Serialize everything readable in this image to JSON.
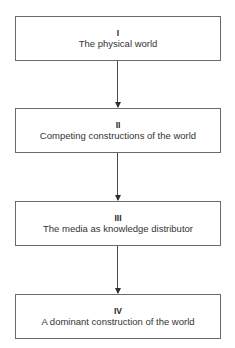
{
  "diagram": {
    "type": "vertical-flowchart",
    "boxes": [
      {
        "numeral": "I",
        "label": "The physical world"
      },
      {
        "numeral": "II",
        "label": "Competing constructions of the world"
      },
      {
        "numeral": "III",
        "label": "The media as knowledge distributor"
      },
      {
        "numeral": "IV",
        "label": "A dominant construction of the world"
      }
    ],
    "connections": [
      {
        "from": "I",
        "to": "II",
        "style": "arrow-down"
      },
      {
        "from": "II",
        "to": "III",
        "style": "arrow-down"
      },
      {
        "from": "III",
        "to": "IV",
        "style": "arrow-down"
      }
    ],
    "colors": {
      "border": "#6a6a6a",
      "text": "#333333",
      "arrow": "#4a4a4a",
      "background": "#ffffff"
    }
  }
}
